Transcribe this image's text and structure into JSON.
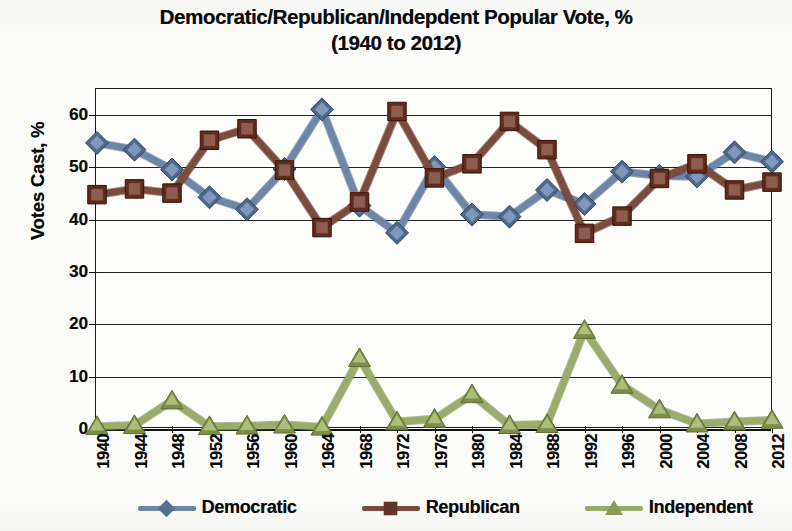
{
  "chart_data": {
    "type": "line",
    "title": "Democratic/Republican/Indepdent Popular Vote, %",
    "subtitle": "(1940 to 2012)",
    "xlabel": "",
    "ylabel": "Votes Cast, %",
    "ylim": [
      0,
      65
    ],
    "yticks": [
      0,
      10,
      20,
      30,
      40,
      50,
      60
    ],
    "grid": true,
    "legend_position": "bottom",
    "categories": [
      "1940",
      "1944",
      "1948",
      "1952",
      "1956",
      "1960",
      "1964",
      "1968",
      "1972",
      "1976",
      "1980",
      "1984",
      "1988",
      "1992",
      "1996",
      "2000",
      "2004",
      "2008",
      "2012"
    ],
    "series": [
      {
        "name": "Democratic",
        "color": "#6d86a8",
        "marker": "diamond",
        "values": [
          54.7,
          53.4,
          49.6,
          44.3,
          42.0,
          49.7,
          61.1,
          42.7,
          37.5,
          50.1,
          41.0,
          40.6,
          45.7,
          43.0,
          49.2,
          48.4,
          48.3,
          52.9,
          51.1
        ]
      },
      {
        "name": "Republican",
        "color": "#7b4b3d",
        "marker": "square",
        "values": [
          44.8,
          45.9,
          45.1,
          55.2,
          57.4,
          49.5,
          38.5,
          43.4,
          60.7,
          48.0,
          50.7,
          58.8,
          53.4,
          37.4,
          40.7,
          47.9,
          50.7,
          45.7,
          47.2
        ]
      },
      {
        "name": "Independent",
        "color": "#9bab69",
        "marker": "triangle",
        "values": [
          0.5,
          0.7,
          5.4,
          0.5,
          0.6,
          0.8,
          0.4,
          13.5,
          1.4,
          1.9,
          6.6,
          0.7,
          0.9,
          18.9,
          8.4,
          3.7,
          1.0,
          1.4,
          1.7
        ]
      }
    ]
  },
  "legend": {
    "items": [
      {
        "label": "Democratic"
      },
      {
        "label": "Republican"
      },
      {
        "label": "Independent"
      }
    ]
  }
}
